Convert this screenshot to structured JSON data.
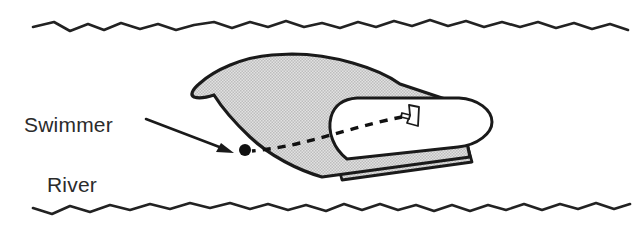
{
  "figure": {
    "background_color": "#ffffff"
  },
  "labels": {
    "swimmer": "Swimmer",
    "river": "River"
  },
  "colors": {
    "ink": "#1a1a1a",
    "text": "#2b2b2b",
    "hull_fill": "#d2d2d2",
    "cockpit_fill": "#ffffff",
    "wave_stroke": "#222222"
  },
  "elements": {
    "swimmer_dot": {
      "name": "swimmer",
      "cx": 245,
      "cy": 150,
      "r": 6
    },
    "driver": {
      "name": "boat-driver",
      "description": "small figure at the helm"
    },
    "sight_line": {
      "name": "line-of-sight",
      "style": "dashed",
      "from": "driver",
      "to": "swimmer"
    },
    "boat": {
      "name": "boat",
      "orientation": "bow-left",
      "fill": "#d2d2d2"
    },
    "waves": {
      "top": "river-bank-top",
      "bottom": "river-bank-bottom"
    },
    "pointer": {
      "name": "swimmer-pointer-arrow",
      "from_label": "Swimmer"
    }
  },
  "geometry": {
    "wave_top_path": "M 33,27 L 54,22 L 70,31 L 88,24 L 104,30 L 121,23 L 140,29 L 158,24 L 176,30 L 194,25 L 214,22 L 232,28 L 250,22 L 268,27 L 286,21 L 304,27 L 322,23 L 340,28 L 358,22 L 376,27 L 394,21 L 412,26 L 430,20 L 448,26 L 466,21 L 484,27 L 502,22 L 520,27 L 538,22 L 556,28 L 574,23 L 592,29 L 610,24 L 628,30",
    "wave_bottom_path": "M 33,208 L 52,214 L 70,206 L 90,212 L 110,205 L 130,210 L 150,204 L 170,209 L 190,203 L 210,208 L 230,203 L 250,209 L 268,204 L 288,210 L 306,205 L 326,211 L 344,204 L 362,210 L 380,204 L 398,210 L 416,205 L 434,211 L 452,205 L 470,211 L 488,205 L 506,210 L 524,204 L 542,210 L 560,204 L 578,209 L 596,203 L 614,209 L 630,204",
    "hull_path": "M 262,55 C 235,57 210,72 196,86 C 190,92 189,96 193,97 C 199,98 206,96 212,94 C 216,100 228,118 248,136 C 268,154 296,168 320,175 C 338,180 448,148 472,140 L 470,118 C 448,112 420,100 400,86 C 372,66 330,54 290,54 Z",
    "cockpit_path": "M 352,99 C 340,100 333,106 331,116 C 328,130 334,146 346,156 C 356,164 440,148 462,142 C 484,136 489,120 481,110 C 474,101 460,98 444,98 Z"
  }
}
